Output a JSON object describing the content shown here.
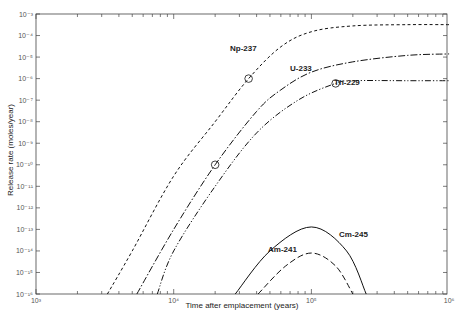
{
  "chart_data": {
    "type": "line",
    "title": "",
    "xlabel": "Time after emplacement (years)",
    "ylabel": "Release rate (moles/year)",
    "xscale": "log",
    "yscale": "log",
    "xlim": [
      1000,
      1000000
    ],
    "ylim": [
      1e-16,
      0.001
    ],
    "x_ticks": [
      "10³",
      "10⁴",
      "10⁵",
      "10⁶"
    ],
    "y_ticks": [
      "10⁻³",
      "10⁻⁴",
      "10⁻⁵",
      "10⁻⁶",
      "10⁻⁷",
      "10⁻⁸",
      "10⁻⁹",
      "10⁻¹⁰",
      "10⁻¹¹",
      "10⁻¹²",
      "10⁻¹³",
      "10⁻¹⁴",
      "10⁻¹⁵",
      "10⁻¹⁶"
    ],
    "grid": false,
    "legend": "inline labels",
    "series": [
      {
        "name": "Np-237",
        "style": "dashed-short",
        "x": [
          3300,
          5000,
          10000,
          20000,
          35000,
          60000,
          100000,
          200000,
          500000,
          1000000
        ],
        "y": [
          1e-16,
          1e-14,
          3e-11,
          1e-08,
          1e-06,
          3e-05,
          0.00015,
          0.00028,
          0.00032,
          0.00032
        ]
      },
      {
        "name": "U-233",
        "style": "dash-dot",
        "x": [
          5400,
          10000,
          20000,
          40000,
          60000,
          100000,
          200000,
          500000,
          1000000
        ],
        "y": [
          1e-16,
          1e-13,
          1e-10,
          3e-08,
          3e-07,
          2e-06,
          6e-06,
          1.2e-05,
          1.4e-05
        ]
      },
      {
        "name": "Th-229",
        "style": "dash-dot-dot",
        "x": [
          7600,
          10000,
          20000,
          40000,
          80000,
          150000,
          200000,
          500000,
          1000000
        ],
        "y": [
          1e-16,
          1e-14,
          1e-11,
          3e-09,
          1e-07,
          6e-07,
          8e-07,
          8e-07,
          8e-07
        ]
      },
      {
        "name": "Cm-245",
        "style": "solid",
        "x": [
          28000,
          50000,
          100000,
          180000,
          250000
        ],
        "y": [
          1e-16,
          1e-14,
          1.3e-13,
          1e-14,
          1e-16
        ]
      },
      {
        "name": "Am-241",
        "style": "dashed-long",
        "x": [
          41000,
          65000,
          100000,
          150000,
          200000
        ],
        "y": [
          1e-16,
          2e-15,
          8e-15,
          2e-15,
          1e-16
        ]
      }
    ],
    "markers": [
      {
        "series": "Np-237",
        "x": 35000,
        "y": 1e-06,
        "shape": "circle"
      },
      {
        "series": "U-233",
        "x": 20000,
        "y": 1e-10,
        "shape": "circle"
      },
      {
        "series": "Th-229",
        "x": 150000,
        "y": 6e-07,
        "shape": "circle"
      }
    ]
  },
  "labels": {
    "xlabel": "Time after emplacement (years)",
    "ylabel": "Release rate (moles/year)",
    "np": "Np-237",
    "u": "U-233",
    "th": "Th-229",
    "cm": "Cm-245",
    "am": "Am-241"
  }
}
